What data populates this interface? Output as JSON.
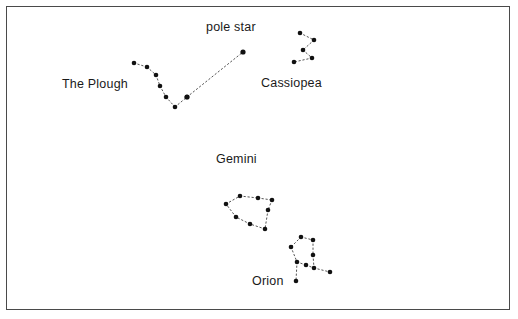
{
  "figure": {
    "name": "night-sky-constellation-chart",
    "background_color": "#ffffff",
    "frame_color": "#4a4a4a",
    "star_color": "#111111",
    "line_color": "#555555",
    "width": 518,
    "height": 319
  },
  "labels": {
    "the_plough": "The Plough",
    "pole_star": "pole star",
    "cassiopea": "Cassiopea",
    "gemini": "Gemini",
    "orion": "Orion"
  },
  "chart_data": {
    "type": "scatter",
    "title": "",
    "xlabel": "",
    "ylabel": "",
    "xlim": [
      0,
      518
    ],
    "ylim": [
      0,
      319
    ],
    "grid": false,
    "legend": "none",
    "note": "Star chart: constellations drawn as dots joined by dotted lines; y increases downward in pixel coordinates.",
    "series": [
      {
        "name": "The Plough",
        "label_text": "The Plough",
        "label_xy": [
          62,
          83
        ],
        "star_radius": 2.3,
        "stars": [
          [
            134,
            63
          ],
          [
            147,
            67
          ],
          [
            156,
            75
          ],
          [
            160,
            86
          ],
          [
            166,
            97
          ],
          [
            175,
            107
          ],
          [
            187,
            97
          ]
        ],
        "links": [
          [
            0,
            1
          ],
          [
            1,
            2
          ],
          [
            2,
            3
          ],
          [
            3,
            4
          ],
          [
            4,
            5
          ],
          [
            5,
            6
          ]
        ]
      },
      {
        "name": "pointer-line-to-pole-star",
        "label_text": "pole star",
        "label_xy": [
          206,
          26
        ],
        "star_radius": 2.6,
        "stars": [
          [
            187,
            97
          ],
          [
            243,
            52
          ]
        ],
        "links": [
          [
            0,
            1
          ]
        ]
      },
      {
        "name": "Cassiopea",
        "label_text": "Cassiopea",
        "label_xy": [
          261,
          82
        ],
        "star_radius": 2.3,
        "stars": [
          [
            300,
            33
          ],
          [
            314,
            40
          ],
          [
            303,
            50
          ],
          [
            312,
            58
          ],
          [
            294,
            62
          ]
        ],
        "links": [
          [
            0,
            1
          ],
          [
            1,
            2
          ],
          [
            2,
            3
          ],
          [
            3,
            4
          ]
        ]
      },
      {
        "name": "Gemini",
        "label_text": "Gemini",
        "label_xy": [
          216,
          158
        ],
        "star_radius": 2.3,
        "stars": [
          [
            240,
            196
          ],
          [
            226,
            204
          ],
          [
            236,
            217
          ],
          [
            250,
            224
          ],
          [
            265,
            229
          ],
          [
            268,
            210
          ],
          [
            272,
            200
          ],
          [
            258,
            198
          ]
        ],
        "links": [
          [
            0,
            7
          ],
          [
            7,
            6
          ],
          [
            6,
            5
          ],
          [
            5,
            4
          ],
          [
            4,
            3
          ],
          [
            3,
            2
          ],
          [
            2,
            1
          ],
          [
            1,
            0
          ]
        ]
      },
      {
        "name": "Orion",
        "label_text": "Orion",
        "label_xy": [
          252,
          280
        ],
        "star_radius": 2.3,
        "stars": [
          [
            301,
            237
          ],
          [
            313,
            240
          ],
          [
            291,
            247
          ],
          [
            313,
            255
          ],
          [
            297,
            262
          ],
          [
            306,
            265
          ],
          [
            314,
            268
          ],
          [
            296,
            281
          ],
          [
            330,
            272
          ]
        ],
        "links": [
          [
            0,
            1
          ],
          [
            0,
            2
          ],
          [
            2,
            4
          ],
          [
            1,
            3
          ],
          [
            3,
            6
          ],
          [
            4,
            5
          ],
          [
            5,
            6
          ],
          [
            4,
            7
          ],
          [
            6,
            8
          ]
        ]
      }
    ]
  }
}
